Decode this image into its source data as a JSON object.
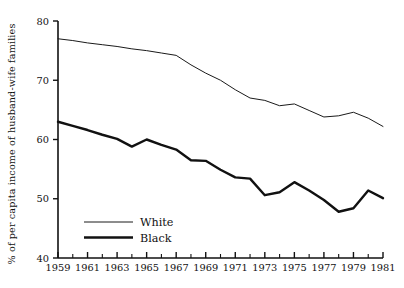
{
  "chart_data": {
    "type": "line",
    "title": "",
    "xlabel": "",
    "ylabel": "% of per capita income of husband-wife families",
    "xlim": [
      1959,
      1981
    ],
    "ylim": [
      40,
      80
    ],
    "grid": false,
    "legend_position": "inside-lower-left",
    "x_tick_labels": [
      "1959",
      "1961",
      "1963",
      "1965",
      "1967",
      "1969",
      "1971",
      "1973",
      "1975",
      "1977",
      "1979",
      "1981"
    ],
    "x_tick_values": [
      1959,
      1961,
      1963,
      1965,
      1967,
      1969,
      1971,
      1973,
      1975,
      1977,
      1979,
      1981
    ],
    "x_minor_tick_values": [
      1960,
      1962,
      1964,
      1966,
      1968,
      1970,
      1972,
      1974,
      1976,
      1978,
      1980
    ],
    "y_tick_labels": [
      "40",
      "50",
      "60",
      "70",
      "80"
    ],
    "y_tick_values": [
      40,
      50,
      60,
      70,
      80
    ],
    "x": [
      1959,
      1960,
      1961,
      1962,
      1963,
      1964,
      1965,
      1966,
      1967,
      1968,
      1969,
      1970,
      1971,
      1972,
      1973,
      1974,
      1975,
      1976,
      1977,
      1978,
      1979,
      1980,
      1981
    ],
    "series": [
      {
        "name": "White",
        "style": "thin",
        "color": "#1a1a1a",
        "linewidth": 1.0,
        "values": [
          77.0,
          76.7,
          76.3,
          76.0,
          75.7,
          75.3,
          75.0,
          74.6,
          74.2,
          72.6,
          71.2,
          70.0,
          68.4,
          67.0,
          66.6,
          65.7,
          66.0,
          64.9,
          63.8,
          64.0,
          64.6,
          63.6,
          62.2
        ]
      },
      {
        "name": "Black",
        "style": "thick",
        "color": "#111111",
        "linewidth": 2.4,
        "values": [
          63.0,
          62.3,
          61.6,
          60.8,
          60.1,
          58.8,
          60.0,
          59.1,
          58.3,
          56.5,
          56.4,
          54.9,
          53.6,
          53.4,
          50.6,
          51.1,
          52.8,
          51.4,
          49.8,
          47.8,
          48.4,
          51.4,
          50.1
        ]
      }
    ]
  },
  "legend": {
    "items": [
      {
        "label": "White",
        "style": "thin"
      },
      {
        "label": "Black",
        "style": "thick"
      }
    ]
  }
}
